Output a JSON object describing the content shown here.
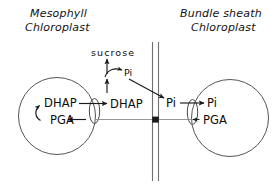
{
  "figure": {
    "type": "biochemical-transport-diagram",
    "background_color": "#ffffff",
    "ink_color": "#1a1a1a"
  },
  "titles": {
    "left_line1": "Mesophyll",
    "left_line2": "Chloroplast",
    "right_line1": "Bundle sheath",
    "right_line2": "Chloroplast"
  },
  "mesophyll": {
    "inner_top_metabolite": "DHAP",
    "inner_bottom_metabolite": "PGA",
    "exported_metabolite": "DHAP"
  },
  "cytosol": {
    "product": "sucrose",
    "released_phosphate": "Pi",
    "transferred_phosphate": "Pi"
  },
  "bundle_sheath": {
    "imported_phosphate": "Pi",
    "exported_metabolite": "PGA"
  },
  "icons": {
    "translocator": "translocator-ellipse-icon",
    "membrane": "cell-wall-membrane-icon",
    "junction": "pathway-junction-node-icon"
  }
}
